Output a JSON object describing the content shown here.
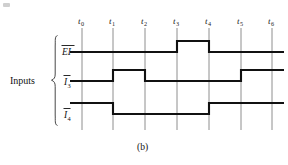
{
  "figure": {
    "caption": "(b)",
    "group_label": "Inputs",
    "background_color": "#ffffff",
    "wave_color": "#111111",
    "grid_color": "#8e8e8e"
  },
  "time_axis": {
    "label_prefix": "t",
    "ticks": [
      {
        "name": "t0",
        "base": "t",
        "sub": "0",
        "x": 82
      },
      {
        "name": "t1",
        "base": "t",
        "sub": "1",
        "x": 113
      },
      {
        "name": "t2",
        "base": "t",
        "sub": "2",
        "x": 145
      },
      {
        "name": "t3",
        "base": "t",
        "sub": "3",
        "x": 177
      },
      {
        "name": "t4",
        "base": "t",
        "sub": "4",
        "x": 209
      },
      {
        "name": "t5",
        "base": "t",
        "sub": "5",
        "x": 241
      },
      {
        "name": "t6",
        "base": "t",
        "sub": "6",
        "x": 272
      }
    ],
    "grid_top": 28,
    "grid_bottom": 130,
    "label_y": 24
  },
  "signals": [
    {
      "name": "EI",
      "base": "EI",
      "sub": "",
      "overbar": true,
      "label_x": 62,
      "label_y": 54,
      "high_y": 41,
      "low_y": 52,
      "x_start": 70,
      "x_end": 284,
      "initial_level": "low",
      "transitions": [
        {
          "at": "t3",
          "x": 177,
          "to": "high"
        },
        {
          "at": "t4",
          "x": 209,
          "to": "low"
        }
      ],
      "levels": [
        "low",
        "low",
        "low",
        "high",
        "low",
        "low",
        "low"
      ]
    },
    {
      "name": "I3",
      "base": "I",
      "sub": "3",
      "overbar": true,
      "label_x": 63,
      "label_y": 84,
      "high_y": 70,
      "low_y": 81,
      "x_start": 70,
      "x_end": 284,
      "initial_level": "low",
      "transitions": [
        {
          "at": "t1",
          "x": 113,
          "to": "high"
        },
        {
          "at": "t2",
          "x": 145,
          "to": "low"
        },
        {
          "at": "t5",
          "x": 241,
          "to": "high"
        }
      ],
      "levels": [
        "low",
        "high",
        "low",
        "low",
        "low",
        "high",
        "high"
      ]
    },
    {
      "name": "I4",
      "base": "I",
      "sub": "4",
      "overbar": true,
      "label_x": 63,
      "label_y": 117,
      "high_y": 103,
      "low_y": 114,
      "x_start": 70,
      "x_end": 284,
      "initial_level": "high",
      "transitions": [
        {
          "at": "t1",
          "x": 113,
          "to": "low"
        },
        {
          "at": "t4",
          "x": 209,
          "to": "high"
        }
      ],
      "levels": [
        "high",
        "low",
        "low",
        "low",
        "high",
        "high",
        "high"
      ]
    }
  ],
  "brace": {
    "x": 56,
    "top": 35,
    "bottom": 126,
    "tip_x": 51,
    "mid_y": 80
  }
}
